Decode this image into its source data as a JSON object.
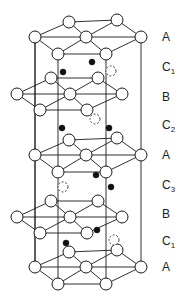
{
  "diagram": {
    "title": "",
    "atom_radius": 6,
    "interstitial_radius": 3,
    "colors": {
      "line": "#1a1a1a",
      "atom_fill": "#ffffff",
      "interstitial_solid": "#111111"
    },
    "layers": [
      {
        "label": "A",
        "sub": "",
        "label_y": 41,
        "type": "A",
        "y_offset": 0
      },
      {
        "label": "C",
        "sub": "1",
        "label_y": 71
      },
      {
        "label": "B",
        "sub": "",
        "label_y": 101,
        "type": "B",
        "y_offset": 0
      },
      {
        "label": "C",
        "sub": "2",
        "label_y": 129
      },
      {
        "label": "A",
        "sub": "",
        "label_y": 159,
        "type": "A",
        "y_offset": 118
      },
      {
        "label": "C",
        "sub": "3",
        "label_y": 189
      },
      {
        "label": "B",
        "sub": "",
        "label_y": 218,
        "type": "B",
        "y_offset": 123
      },
      {
        "label": "C",
        "sub": "1",
        "label_y": 245
      },
      {
        "label": "A",
        "sub": "",
        "label_y": 271,
        "type": "A",
        "y_offset": 230
      }
    ],
    "label_x": 162,
    "interstitials": [
      {
        "group": "C1",
        "x": 92,
        "y": 62,
        "style": "solid"
      },
      {
        "group": "C1",
        "x": 63,
        "y": 72,
        "style": "solid"
      },
      {
        "group": "C1",
        "x": 111,
        "y": 71,
        "style": "dashed"
      },
      {
        "group": "C2",
        "x": 62,
        "y": 128,
        "style": "solid"
      },
      {
        "group": "C2",
        "x": 109,
        "y": 128,
        "style": "solid"
      },
      {
        "group": "C2",
        "x": 95,
        "y": 119,
        "style": "dashed"
      },
      {
        "group": "C3",
        "x": 96,
        "y": 175,
        "style": "solid"
      },
      {
        "group": "C3",
        "x": 111,
        "y": 187,
        "style": "solid"
      },
      {
        "group": "C3",
        "x": 63,
        "y": 187,
        "style": "dashed"
      },
      {
        "group": "C1",
        "x": 97,
        "y": 230,
        "style": "solid"
      },
      {
        "group": "C1",
        "x": 66,
        "y": 243,
        "style": "solid"
      },
      {
        "group": "C1",
        "x": 114,
        "y": 240,
        "style": "dashed"
      }
    ]
  }
}
